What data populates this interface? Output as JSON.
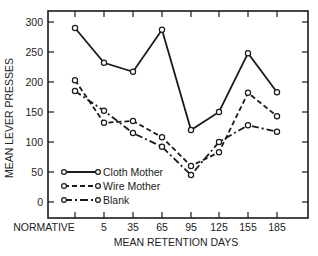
{
  "chart_data": {
    "type": "line",
    "title": "",
    "xlabel": "MEAN RETENTION DAYS",
    "ylabel": "MEAN LEVER PRESSES",
    "categories": [
      "NORMATIVE",
      "5",
      "35",
      "65",
      "95",
      "125",
      "155",
      "185"
    ],
    "yticks": [
      0,
      50,
      100,
      150,
      200,
      250,
      300
    ],
    "ylim": [
      -25,
      310
    ],
    "grid": false,
    "legend_position": "lower-left inside",
    "series": [
      {
        "name": "Cloth Mother",
        "style": "solid",
        "values": [
          290,
          232,
          217,
          287,
          120,
          150,
          248,
          183
        ]
      },
      {
        "name": "Wire Mother",
        "style": "dashed",
        "values": [
          203,
          132,
          135,
          108,
          60,
          83,
          182,
          143
        ]
      },
      {
        "name": "Blank",
        "style": "dash-dot",
        "values": [
          185,
          152,
          115,
          92,
          45,
          100,
          128,
          117
        ]
      }
    ]
  },
  "colors": {
    "line": "#1a1a1a",
    "axis": "#1a1a1a",
    "text": "#222222",
    "background": "#ffffff"
  }
}
